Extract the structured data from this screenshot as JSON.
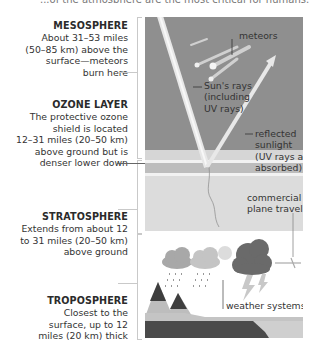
{
  "header": {
    "cut_off_text": "...of the atmosphere are the most critical for humans."
  },
  "layers": [
    {
      "id": "mesosphere",
      "title": "MESOSPHERE",
      "description_lines": [
        "About 31–53 miles",
        "(50–85 km) above the",
        "surface—meteors",
        "burn here"
      ]
    },
    {
      "id": "ozone",
      "title": "OZONE LAYER",
      "description_lines": [
        "The protective ozone",
        "shield is located",
        "12–31 miles (20–50 km)",
        "above ground but is",
        "denser lower down"
      ]
    },
    {
      "id": "stratosphere",
      "title": "STRATOSPHERE",
      "description_lines": [
        "Extends from about 12",
        "to 31 miles (20–50 km)",
        "above ground"
      ]
    },
    {
      "id": "troposphere",
      "title": "TROPOSPHERE",
      "description_lines": [
        "Closest to the",
        "surface, up to 12",
        "miles (20 km) thick"
      ]
    }
  ],
  "diagram": {
    "labels": {
      "meteors": "meteors",
      "suns_rays": [
        "Sun's rays",
        "(including",
        "UV rays)"
      ],
      "reflected": [
        "reflected",
        "sunlight",
        "(UV rays are",
        "absorbed)"
      ],
      "plane": [
        "commercial",
        "plane travel"
      ],
      "weather": "weather systems"
    },
    "colors": {
      "mesosphere": "#8f8f8f",
      "ozone_light": "#d6d6d6",
      "ozone_dense": "#bdbdbd",
      "stratosphere": "#dcdcdc",
      "troposphere": "#ffffff",
      "ground": "#4a4a4a",
      "sea": "#c8c8c8",
      "storm_cloud": "#6a6a6a",
      "cloud": "#a8a8a8"
    }
  }
}
